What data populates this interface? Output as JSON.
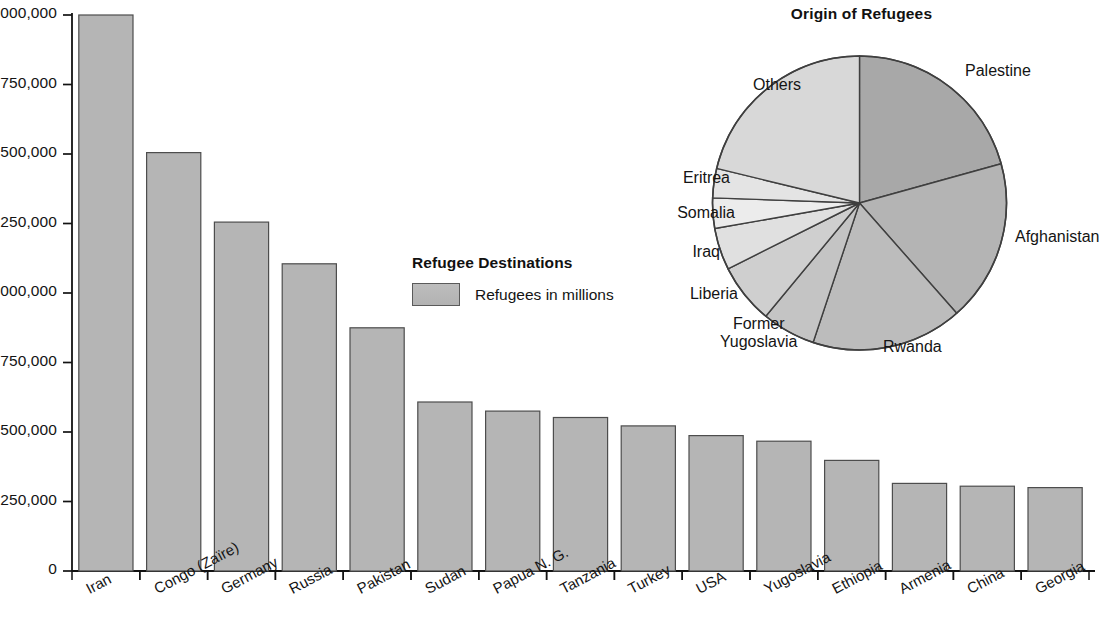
{
  "chart_data": [
    {
      "type": "bar",
      "title": "Refugee Destinations",
      "xlabel": "",
      "ylabel": "",
      "ylim": [
        0,
        2000000
      ],
      "grid": false,
      "legend_position": "center",
      "legend": [
        "Refugees in millions"
      ],
      "ytick_labels": [
        "0",
        "250,000",
        "500,000",
        "750,000",
        "1,000,000",
        "1,250,000",
        "1,500,000",
        "1,750,000",
        "2,000,000"
      ],
      "yticks": [
        0,
        250000,
        500000,
        750000,
        1000000,
        1250000,
        1500000,
        1750000,
        2000000
      ],
      "categories": [
        "Iran",
        "Congo (Zaïre)",
        "Germany",
        "Russia",
        "Pakistan",
        "Sudan",
        "Papua N. G.",
        "Tanzania",
        "Turkey",
        "USA",
        "Yugoslavia",
        "Ethiopia",
        "Armenia",
        "China",
        "Georgia"
      ],
      "values": [
        2000000,
        1505000,
        1255000,
        1105000,
        875000,
        608000,
        575000,
        552000,
        522000,
        487000,
        467000,
        398000,
        315000,
        305000,
        300000
      ]
    },
    {
      "type": "pie",
      "title": "Origin of Refugees",
      "labels": [
        "Palestine",
        "Afghanistan",
        "Rwanda",
        "Former Yugoslavia",
        "Liberia",
        "Iraq",
        "Somalia",
        "Eritrea",
        "Others"
      ],
      "start_angles_deg": [
        0,
        74.5,
        138.6,
        198.4,
        219.6,
        243.4,
        260.0,
        272.0,
        283.6
      ],
      "end_angles_deg": [
        74.5,
        138.6,
        198.4,
        219.6,
        243.4,
        260.0,
        272.0,
        283.6,
        360
      ],
      "values": [
        20.7,
        17.8,
        16.6,
        5.9,
        6.6,
        4.6,
        3.3,
        3.2,
        21.2
      ],
      "slice_shades": [
        "#a8a8a8",
        "#b4b4b4",
        "#bcbcbc",
        "#c4c4c4",
        "#cfcfcf",
        "#e0e0e0",
        "#ececec",
        "#e4e4e4",
        "#d8d8d8"
      ]
    }
  ],
  "bar_chart": {
    "legend": {
      "title": "Refugee Destinations",
      "series_label": "Refugees in millions",
      "swatch_color": "#b5b5b5"
    },
    "axis": {
      "tick_labels": [
        "2,000,000",
        "1,750,000",
        "1,500,000",
        "1,250,000",
        "1,000,000",
        "750,000",
        "500,000",
        "250,000",
        "0"
      ]
    },
    "bars": [
      {
        "label": "Iran",
        "value": 2000000
      },
      {
        "label": "Congo (Zaïre)",
        "value": 1505000
      },
      {
        "label": "Germany",
        "value": 1255000
      },
      {
        "label": "Russia",
        "value": 1105000
      },
      {
        "label": "Pakistan",
        "value": 875000
      },
      {
        "label": "Sudan",
        "value": 608000
      },
      {
        "label": "Papua N. G.",
        "value": 575000
      },
      {
        "label": "Tanzania",
        "value": 552000
      },
      {
        "label": "Turkey",
        "value": 522000
      },
      {
        "label": "USA",
        "value": 487000
      },
      {
        "label": "Yugoslavia",
        "value": 467000
      },
      {
        "label": "Ethiopia",
        "value": 398000
      },
      {
        "label": "Armenia",
        "value": 315000
      },
      {
        "label": "China",
        "value": 305000
      },
      {
        "label": "Georgia",
        "value": 300000
      }
    ]
  },
  "pie_chart": {
    "title": "Origin of Refugees",
    "slices": [
      {
        "label": "Palestine",
        "value": 20.7,
        "shade": "#a8a8a8"
      },
      {
        "label": "Afghanistan",
        "value": 17.8,
        "shade": "#b4b4b4"
      },
      {
        "label": "Rwanda",
        "value": 16.6,
        "shade": "#bcbcbc"
      },
      {
        "label": "Former Yugoslavia",
        "value": 5.9,
        "shade": "#c4c4c4"
      },
      {
        "label": "Liberia",
        "value": 6.6,
        "shade": "#cfcfcf"
      },
      {
        "label": "Iraq",
        "value": 4.6,
        "shade": "#e0e0e0"
      },
      {
        "label": "Somalia",
        "value": 3.3,
        "shade": "#ececec"
      },
      {
        "label": "Eritrea",
        "value": 3.2,
        "shade": "#e4e4e4"
      },
      {
        "label": "Others",
        "value": 21.2,
        "shade": "#d8d8d8"
      }
    ],
    "label_former_line1": "Former",
    "label_former_line2": "Yugoslavia"
  },
  "colors": {
    "bar_fill": "#b5b5b5",
    "bar_stroke": "#4d4d4d",
    "axis": "#121212",
    "text": "#141414",
    "background": "#ffffff"
  }
}
